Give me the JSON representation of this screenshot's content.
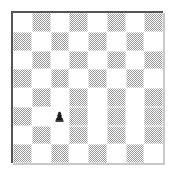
{
  "diagram": {
    "type": "chessboard",
    "files": 8,
    "ranks": 8,
    "orientation": "white-bottom",
    "colors": {
      "light_square": "#ffffff",
      "dark_square": "#9a9a9a",
      "border": "#555555",
      "piece_black": "#1a1a1a",
      "background": "#ffffff"
    },
    "squares": [
      [
        "light",
        "dark",
        "light",
        "dark",
        "light",
        "dark",
        "light",
        "dark"
      ],
      [
        "dark",
        "light",
        "dark",
        "light",
        "dark",
        "light",
        "dark",
        "light"
      ],
      [
        "light",
        "dark",
        "light",
        "dark",
        "light",
        "dark",
        "light",
        "dark"
      ],
      [
        "dark",
        "light",
        "dark",
        "light",
        "dark",
        "light",
        "dark",
        "light"
      ],
      [
        "light",
        "dark",
        "light",
        "dark",
        "light",
        "dark",
        "light",
        "dark"
      ],
      [
        "dark",
        "light",
        "light",
        "dark",
        "light",
        "dark",
        "light",
        "dark"
      ],
      [
        "light",
        "dark",
        "light",
        "dark",
        "light",
        "dark",
        "light",
        "dark"
      ],
      [
        "dark",
        "light",
        "dark",
        "light",
        "dark",
        "light",
        "dark",
        "light"
      ]
    ],
    "pieces": [
      {
        "name": "pawn",
        "color": "black",
        "glyph": "pawn-icon",
        "file_index": 2,
        "rank_index": 5,
        "square": "c3"
      }
    ]
  }
}
